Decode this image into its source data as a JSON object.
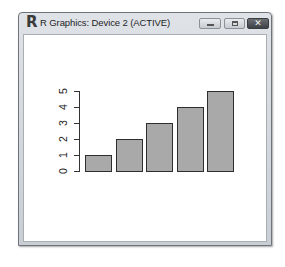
{
  "window": {
    "title": "R Graphics: Device 2 (ACTIVE)",
    "icon": "r-logo-icon",
    "buttons": {
      "minimize": "minimize-icon",
      "maximize": "maximize-icon",
      "close": "close-icon",
      "close_glyph": "✕"
    },
    "r_glyph": "R"
  },
  "chart_data": {
    "type": "bar",
    "categories": [
      "1",
      "2",
      "3",
      "4",
      "5"
    ],
    "values": [
      1,
      2,
      3,
      4,
      5
    ],
    "title": "",
    "xlabel": "",
    "ylabel": "",
    "ylim": [
      0,
      5
    ],
    "yticks": [
      "0",
      "1",
      "2",
      "3",
      "4",
      "5"
    ],
    "grid": false,
    "legend": null,
    "bar_color": "#a9a9a9",
    "border_color": "#2e2e2e",
    "y_tick_label_rotation": 90
  }
}
